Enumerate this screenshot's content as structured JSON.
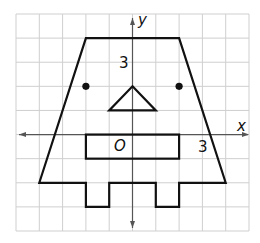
{
  "diagram": {
    "type": "coordinate-grid-figure",
    "grid": {
      "x_range": [
        -5,
        5
      ],
      "y_range": [
        -4,
        5
      ],
      "unit": 1,
      "line_color": "#cfcfcf"
    },
    "axes": {
      "x_label": "x",
      "y_label": "y",
      "origin_label": "O",
      "x_tick_label": "3",
      "x_tick_value": 3,
      "y_tick_label": "3",
      "y_tick_value": 3,
      "color": "#555555"
    },
    "figure": {
      "stroke_color": "#111111",
      "outline_vertices": [
        [
          -2,
          4
        ],
        [
          2,
          4
        ],
        [
          4,
          -2
        ],
        [
          2,
          -2
        ],
        [
          2,
          -3
        ],
        [
          1,
          -3
        ],
        [
          1,
          -2
        ],
        [
          -1,
          -2
        ],
        [
          -1,
          -3
        ],
        [
          -2,
          -3
        ],
        [
          -2,
          -2
        ],
        [
          -4,
          -2
        ]
      ],
      "eyes": [
        [
          -2,
          2
        ],
        [
          2,
          2
        ]
      ],
      "nose_triangle": [
        [
          0,
          2
        ],
        [
          1,
          1
        ],
        [
          -1,
          1
        ]
      ],
      "mouth_rectangle": {
        "x1": -2,
        "y1": 0,
        "x2": 2,
        "y2": -1
      }
    }
  }
}
